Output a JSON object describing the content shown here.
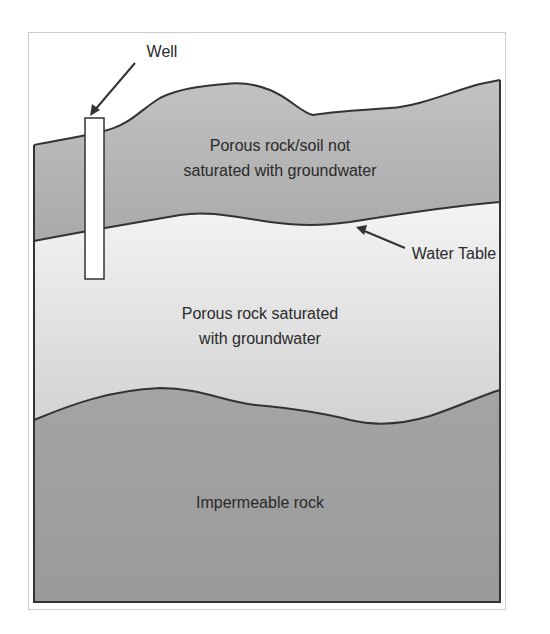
{
  "diagram": {
    "labels": {
      "well": "Well",
      "unsaturated_line1": "Porous rock/soil not",
      "unsaturated_line2": "saturated with groundwater",
      "water_table": "Water Table",
      "saturated_line1": "Porous rock saturated",
      "saturated_line2": "with groundwater",
      "impermeable": "Impermeable rock"
    },
    "layers": [
      {
        "name": "unsaturated-zone",
        "label": "Porous rock/soil not saturated with groundwater",
        "color": "#b4b4b4"
      },
      {
        "name": "saturated-zone",
        "label": "Porous rock saturated with groundwater",
        "color": "#e6e6e6"
      },
      {
        "name": "impermeable-rock",
        "label": "Impermeable rock",
        "color": "#a2a2a2"
      }
    ],
    "colors": {
      "outline": "#333333",
      "frame": "#cccccc",
      "text": "#2a2a2a",
      "well_fill": "#ffffff"
    }
  }
}
